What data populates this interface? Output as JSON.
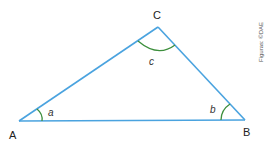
{
  "diagram": {
    "type": "triangle",
    "vertices": [
      {
        "name": "A",
        "x": 19,
        "y": 121
      },
      {
        "name": "B",
        "x": 245,
        "y": 120
      },
      {
        "name": "C",
        "x": 158,
        "y": 27
      }
    ],
    "labels": {
      "vertex_a": "A",
      "vertex_b": "B",
      "vertex_c": "C",
      "angle_a": "a",
      "angle_b": "b",
      "angle_c": "c"
    },
    "credit": "Figuras: ©DAE",
    "colors": {
      "side": "#4aa3df",
      "angle_arc": "#3d8f3d",
      "text": "#222222"
    }
  }
}
